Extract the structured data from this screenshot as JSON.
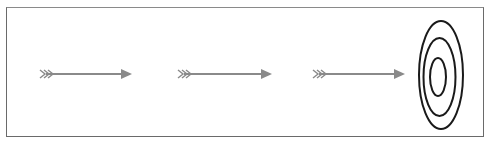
{
  "diagram": {
    "type": "arrows-to-target",
    "colors": {
      "arrow": "#8a8a8a",
      "target_rings": "#1a1a1a",
      "frame": "#6a6a6a",
      "background": "#ffffff"
    },
    "arrows": [
      {
        "x1": 40,
        "x2": 132,
        "y": 74
      },
      {
        "x1": 178,
        "x2": 272,
        "y": 74
      },
      {
        "x1": 313,
        "x2": 405,
        "y": 74
      }
    ],
    "target": {
      "cx": 441,
      "cy": 75,
      "rings": [
        {
          "rx": 22,
          "ry": 54
        },
        {
          "rx": 16,
          "ry": 39
        },
        {
          "rx": 8,
          "ry": 19
        }
      ]
    }
  }
}
